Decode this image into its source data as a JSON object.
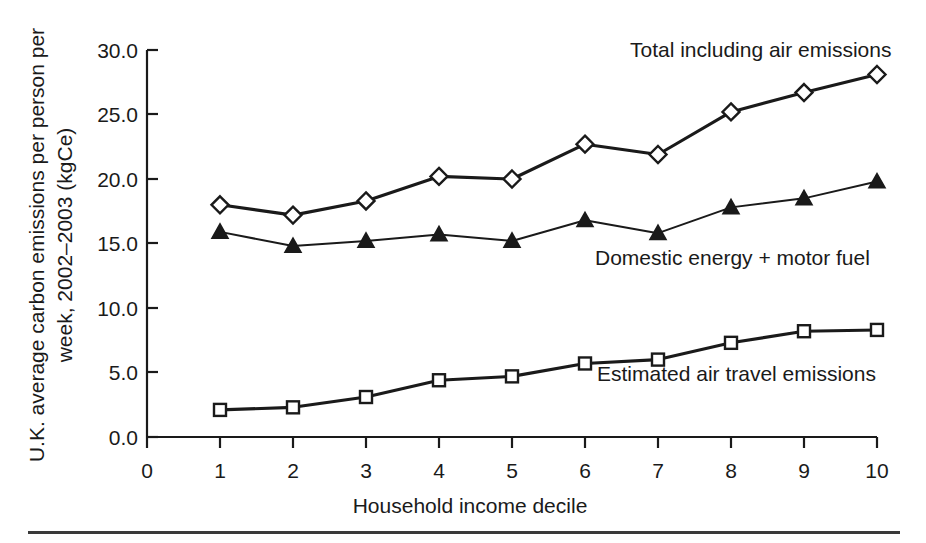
{
  "chart_data": {
    "type": "line",
    "title": "",
    "xlabel": "Household income decile",
    "ylabel": "U.K. average carbon emissions per person per week, 2002–2003 (kgCe)",
    "ylabel_line1": "U.K. average carbon emissions per person per",
    "ylabel_line2": "week, 2002–2003 (kgCe)",
    "x": [
      1,
      2,
      3,
      4,
      5,
      6,
      7,
      8,
      9,
      10
    ],
    "categories": [
      "1",
      "2",
      "3",
      "4",
      "5",
      "6",
      "7",
      "8",
      "9",
      "10"
    ],
    "xticks": [
      "0",
      "1",
      "2",
      "3",
      "4",
      "5",
      "6",
      "7",
      "8",
      "9",
      "10"
    ],
    "yticks": [
      "0.0",
      "5.0",
      "10.0",
      "15.0",
      "20.0",
      "25.0",
      "30.0"
    ],
    "xlim": [
      0,
      10
    ],
    "ylim": [
      0,
      30
    ],
    "grid": false,
    "legend_position": "inline-annotations",
    "series": [
      {
        "name": "Total including air emissions",
        "marker": "open-diamond",
        "values": [
          18.0,
          17.2,
          18.3,
          20.2,
          20.0,
          22.7,
          21.9,
          25.2,
          26.7,
          28.1
        ]
      },
      {
        "name": "Domestic energy + motor fuel",
        "marker": "filled-triangle",
        "values": [
          15.9,
          14.8,
          15.2,
          15.7,
          15.2,
          16.8,
          15.8,
          17.8,
          18.5,
          19.8
        ]
      },
      {
        "name": "Estimated air travel emissions",
        "marker": "open-square",
        "values": [
          2.1,
          2.3,
          3.1,
          4.4,
          4.7,
          5.7,
          6.0,
          7.3,
          8.2,
          8.3
        ]
      }
    ],
    "annotations": [
      {
        "text": "Total including air emissions",
        "x": 7.05,
        "y": 29.1
      },
      {
        "text": "Domestic energy + motor fuel",
        "x": 6.2,
        "y": 14.3
      },
      {
        "text": "Estimated air travel emissions",
        "x": 6.2,
        "y": 5.4
      }
    ],
    "colors": {
      "line": "#1a1a1a",
      "marker_fill": "#ffffff",
      "background": "#ffffff"
    }
  }
}
